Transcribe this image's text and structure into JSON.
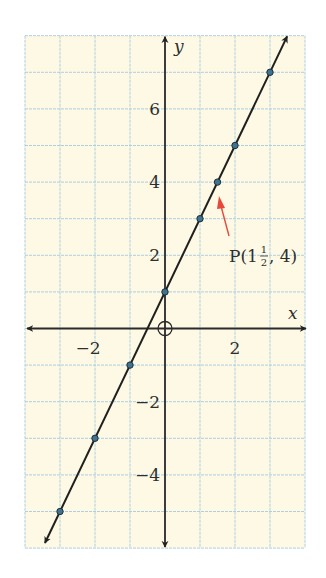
{
  "chart_data": {
    "type": "line",
    "title": "",
    "xlabel": "x",
    "ylabel": "y",
    "xlim": [
      -4,
      4
    ],
    "ylim": [
      -6,
      8
    ],
    "grid": true,
    "x_ticks": [
      -2,
      2
    ],
    "y_ticks": [
      -4,
      -2,
      2,
      4,
      6
    ],
    "x_tick_labels": [
      "−2",
      "2"
    ],
    "y_tick_labels": [
      "−4",
      "−2",
      "2",
      "4",
      "6"
    ],
    "series": [
      {
        "name": "y = 2x + 1",
        "points": [
          {
            "x": -3,
            "y": -5
          },
          {
            "x": -2,
            "y": -3
          },
          {
            "x": -1,
            "y": -1
          },
          {
            "x": 0,
            "y": 1
          },
          {
            "x": 1,
            "y": 3
          },
          {
            "x": 1.5,
            "y": 4
          },
          {
            "x": 2,
            "y": 5
          },
          {
            "x": 3,
            "y": 7
          }
        ],
        "line_extends": {
          "from": {
            "x": -3.43,
            "y": -5.86
          },
          "to": {
            "x": 3.49,
            "y": 7.98
          }
        }
      }
    ],
    "annotations": [
      {
        "text_main": "P(1",
        "frac_num": "1",
        "frac_den": "2",
        "text_tail": ", 4)",
        "points_to": {
          "x": 1.5,
          "y": 4
        },
        "arrow_color": "#e8483a"
      }
    ],
    "origin_marker": "circle-crosshair",
    "colors": {
      "background": "#fdf9e4",
      "grid": "#aecfe0",
      "axis": "#2a2a2a",
      "line": "#1f1f1f",
      "point_fill": "#3f7390",
      "arrow": "#e8483a"
    }
  }
}
